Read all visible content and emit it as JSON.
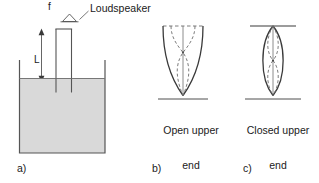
{
  "figure": {
    "panels": [
      {
        "key": "a",
        "index_label": "a)",
        "callout_label": "Loudspeaker",
        "frequency_symbol": "f",
        "length_symbol": "L",
        "icons": [
          "loudspeaker-icon",
          "dimension-arrow-icon"
        ],
        "liquid_fill_color": "#d9d9d9",
        "line_color": "#555555"
      },
      {
        "key": "b",
        "index_label": "b)",
        "caption_line1": "Open upper",
        "caption_line2": "end",
        "shape_name": "parabolic-open-tube-mode",
        "line_color": "#3a3a3a",
        "dashed_color": "#6e6e6e"
      },
      {
        "key": "c",
        "index_label": "c)",
        "caption_line1": "Closed upper",
        "caption_line2": "end",
        "shape_name": "lens-closed-tube-mode",
        "line_color": "#3a3a3a",
        "dashed_color": "#6e6e6e"
      }
    ],
    "background_color": "#ffffff"
  }
}
